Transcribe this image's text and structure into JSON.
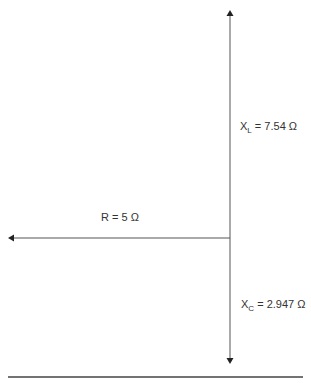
{
  "diagram": {
    "phasors": [
      {
        "name": "XL",
        "symbol": "X",
        "subscript": "L",
        "value_text": "= 7.54 Ω",
        "direction": "up"
      },
      {
        "name": "R",
        "label": "R = 5 Ω",
        "direction": "left"
      },
      {
        "name": "XC",
        "symbol": "X",
        "subscript": "C",
        "value_text": "= 2.947 Ω",
        "direction": "down"
      }
    ],
    "colors": {
      "line": "#555555",
      "text": "#333333"
    }
  }
}
